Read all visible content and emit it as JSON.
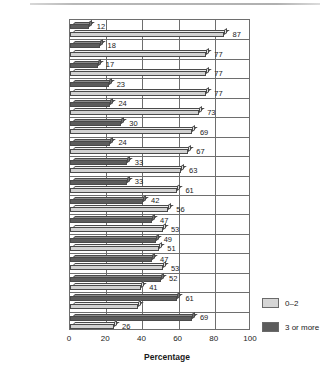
{
  "chart_data": {
    "type": "bar",
    "orientation": "horizontal",
    "title": "",
    "xlabel": "Percentage",
    "ylabel": "",
    "xlim": [
      0,
      100
    ],
    "xticks": [
      0,
      20,
      40,
      60,
      80,
      100
    ],
    "grid": true,
    "legend_position": "right-bottom",
    "categories": [
      "India",
      "Spain",
      "Germany",
      "Colombia",
      "Hungary",
      "Thailand",
      "Great Britain",
      "Lithuania",
      "Canada",
      "Mexico",
      "Singapore",
      "France",
      "United States",
      "Taiwan",
      "Guatemala",
      "Iceland"
    ],
    "series": [
      {
        "name": "3 or more",
        "color": "#5c5c5c",
        "values": [
          12,
          18,
          17,
          23,
          24,
          30,
          24,
          33,
          33,
          42,
          47,
          49,
          47,
          52,
          61,
          69
        ],
        "labels": [
          "12",
          "18",
          "17",
          "23",
          "24",
          "30",
          "24",
          "33",
          "33",
          "42",
          "47",
          "49",
          "47",
          "52",
          "61",
          "69"
        ]
      },
      {
        "name": "0–2",
        "color": "#d2d2d2",
        "values": [
          87,
          77,
          77,
          77,
          73,
          69,
          67,
          63,
          61,
          56,
          53,
          51,
          53,
          41,
          39,
          26
        ],
        "labels": [
          "87",
          "77",
          "77",
          "77",
          "73",
          "69",
          "67",
          "63",
          "61",
          "56",
          "53",
          "51",
          "53",
          "41",
          "",
          "26"
        ]
      }
    ]
  },
  "legend": {
    "items": [
      {
        "label": "0–2",
        "swatch": "light"
      },
      {
        "label": "3 or more",
        "swatch": "dark"
      }
    ]
  },
  "axis": {
    "x_label": "Percentage",
    "x_ticks": [
      "0",
      "20",
      "40",
      "60",
      "80",
      "100"
    ]
  }
}
